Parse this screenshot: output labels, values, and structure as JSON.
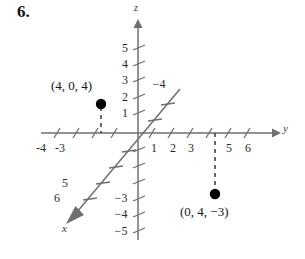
{
  "problem": {
    "number": "6."
  },
  "figure": {
    "type": "3d-coordinate-axes-plot",
    "axes": [
      {
        "name": "x",
        "label": "x",
        "label_pos": {
          "x": 62,
          "y": 228
        },
        "direction": "down-left"
      },
      {
        "name": "y",
        "label": "y",
        "label_pos": {
          "x": 285,
          "y": 128
        },
        "direction": "right"
      },
      {
        "name": "z",
        "label": "z",
        "label_pos": {
          "x": 135,
          "y": 5
        },
        "direction": "up"
      }
    ],
    "origin": {
      "x": 138,
      "y": 133
    },
    "y_axis_ticks": [
      {
        "value": "-4",
        "x": 40
      },
      {
        "value": "-3",
        "x": 59
      },
      {
        "value": "1",
        "x": 154
      },
      {
        "value": "2",
        "x": 173
      },
      {
        "value": "3",
        "x": 191
      },
      {
        "value": "5",
        "x": 229
      },
      {
        "value": "6",
        "x": 248
      }
    ],
    "z_axis_ticks": [
      {
        "value": "5",
        "y": 48
      },
      {
        "value": "4",
        "y": 64
      },
      {
        "value": "3",
        "y": 80
      },
      {
        "value": "2",
        "y": 97
      },
      {
        "value": "1",
        "y": 113
      },
      {
        "value": "−3",
        "y": 198
      },
      {
        "value": "−4",
        "y": 214
      },
      {
        "value": "−5",
        "y": 231
      }
    ],
    "x_axis_ticks": [
      {
        "value": "5",
        "x": 64,
        "y": 183
      },
      {
        "value": "6",
        "x": 56,
        "y": 198
      }
    ],
    "x_axis_inner_label": {
      "value": "−4",
      "x": 157,
      "y": 84
    },
    "points": [
      {
        "name": "point-4-0-4",
        "label": "(4, 0, 4)",
        "label_x": 51,
        "label_y": 78,
        "dot_x": 101,
        "dot_y": 104,
        "drop_to_y": 133
      },
      {
        "name": "point-0-4-neg3",
        "label": "(0, 4, −3)",
        "label_x": 180,
        "label_y": 206,
        "dot_x": 215,
        "dot_y": 194,
        "drop_to_y": 133
      }
    ],
    "colors": {
      "axis": "#6f6f6f",
      "dash": "#2a2a2a",
      "dot": "#000000",
      "text": "#1a1a1a",
      "background": "#ffffff"
    }
  }
}
